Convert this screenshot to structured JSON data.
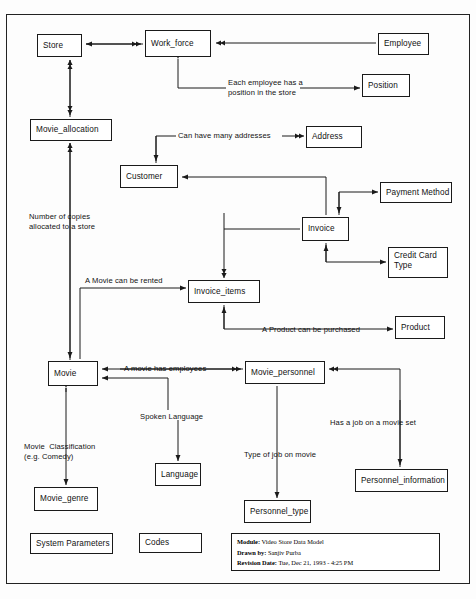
{
  "diagram": {
    "kind": "entity-relationship-data-model",
    "entities": [
      {
        "id": "store",
        "label": "Store",
        "x": 37,
        "y": 34,
        "w": 45,
        "h": 23
      },
      {
        "id": "work_force",
        "label": "Work_force",
        "x": 145,
        "y": 30,
        "w": 66,
        "h": 27
      },
      {
        "id": "employee",
        "label": "Employee",
        "x": 378,
        "y": 33,
        "w": 51,
        "h": 22
      },
      {
        "id": "position",
        "label": "Position",
        "x": 362,
        "y": 74,
        "w": 48,
        "h": 23
      },
      {
        "id": "movie_allocation",
        "label": "Movie_allocation",
        "x": 30,
        "y": 119,
        "w": 82,
        "h": 22
      },
      {
        "id": "address",
        "label": "Address",
        "x": 306,
        "y": 126,
        "w": 56,
        "h": 22
      },
      {
        "id": "customer",
        "label": "Customer",
        "x": 120,
        "y": 165,
        "w": 58,
        "h": 23
      },
      {
        "id": "payment_method",
        "label": "Payment Method",
        "x": 380,
        "y": 182,
        "w": 72,
        "h": 21
      },
      {
        "id": "invoice",
        "label": "Invoice",
        "x": 302,
        "y": 217,
        "w": 47,
        "h": 24
      },
      {
        "id": "credit_card_type",
        "label": "Credit Card\nType",
        "x": 388,
        "y": 247,
        "w": 60,
        "h": 31
      },
      {
        "id": "invoice_items",
        "label": "Invoice_items",
        "x": 188,
        "y": 280,
        "w": 72,
        "h": 23
      },
      {
        "id": "product",
        "label": "Product",
        "x": 395,
        "y": 316,
        "w": 50,
        "h": 23
      },
      {
        "id": "movie",
        "label": "Movie",
        "x": 48,
        "y": 361,
        "w": 50,
        "h": 25
      },
      {
        "id": "movie_personnel",
        "label": "Movie_personnel",
        "x": 245,
        "y": 361,
        "w": 80,
        "h": 23
      },
      {
        "id": "language",
        "label": "Language",
        "x": 155,
        "y": 463,
        "w": 46,
        "h": 23
      },
      {
        "id": "personnel_information",
        "label": "Personnel_information",
        "x": 355,
        "y": 469,
        "w": 93,
        "h": 23
      },
      {
        "id": "movie_genre",
        "label": "Movie_genre",
        "x": 34,
        "y": 487,
        "w": 64,
        "h": 24
      },
      {
        "id": "personnel_type",
        "label": "Personnel_type",
        "x": 244,
        "y": 500,
        "w": 67,
        "h": 23
      },
      {
        "id": "system_parameters",
        "label": "System Parameters",
        "x": 30,
        "y": 533,
        "w": 83,
        "h": 21
      },
      {
        "id": "codes",
        "label": "Codes",
        "x": 139,
        "y": 533,
        "w": 63,
        "h": 20
      }
    ],
    "relationship_labels": [
      {
        "id": "employee-position",
        "text": "Each employee has a\nposition in the store",
        "x": 228,
        "y": 78,
        "align": "left"
      },
      {
        "id": "many-addresses",
        "text": "Can have many addresses",
        "x": 178,
        "y": 131,
        "align": "left"
      },
      {
        "id": "copies-allocated",
        "text": "Number of copies\nallocated to a store",
        "x": 29,
        "y": 212,
        "align": "left"
      },
      {
        "id": "movie-rented",
        "text": "A Movie can be rented",
        "x": 85,
        "y": 276,
        "align": "left"
      },
      {
        "id": "product-purchased",
        "text": "A Product can be purchased",
        "x": 262,
        "y": 325,
        "align": "left"
      },
      {
        "id": "movie-has-employees",
        "text": "A movie has employees",
        "x": 124,
        "y": 364,
        "align": "left"
      },
      {
        "id": "spoken-language",
        "text": "Spoken Language",
        "x": 140,
        "y": 412,
        "align": "left"
      },
      {
        "id": "job-on-movie-set",
        "text": "Has a job on a movie set",
        "x": 330,
        "y": 418,
        "align": "left"
      },
      {
        "id": "movie-classification",
        "text": "Movie  Classification\n(e.g. Comedy)",
        "x": 24,
        "y": 442,
        "align": "left"
      },
      {
        "id": "type-of-job",
        "text": "Type of job on movie",
        "x": 244,
        "y": 450,
        "align": "left"
      }
    ]
  },
  "title_block": {
    "module_key": "Module:",
    "module_value": "Video Store Data Model",
    "drawn_by_key": "Drawn  by:",
    "drawn_by_value": "Sanjiv Purba",
    "revision_key": "Revision Date:",
    "revision_value": "Tue, Dec 21, 1993 - 4:25 PM"
  },
  "colors": {
    "line": "#1a1a1a",
    "text": "#111111",
    "background": "#ffffff"
  }
}
